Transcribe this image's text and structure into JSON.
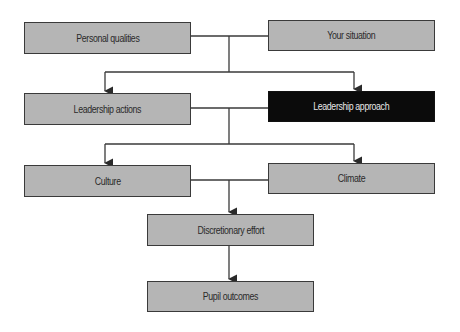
{
  "diagram": {
    "type": "flowchart",
    "colors": {
      "box_fill": "#b5b5b5",
      "box_border": "#3a3a3a",
      "highlight_fill": "#0b0b0b",
      "highlight_text": "#e8e8e8",
      "line": "#3a3a3a"
    },
    "nodes": [
      {
        "id": "personal-qualities",
        "label": "Personal qualities"
      },
      {
        "id": "your-situation",
        "label": "Your situation"
      },
      {
        "id": "leadership-actions",
        "label": "Leadership actions"
      },
      {
        "id": "leadership-approach",
        "label": "Leadership approach",
        "highlighted": true
      },
      {
        "id": "culture",
        "label": "Culture"
      },
      {
        "id": "climate",
        "label": "Climate"
      },
      {
        "id": "discretionary-effort",
        "label": "Discretionary effort"
      },
      {
        "id": "pupil-outcomes",
        "label": "Pupil outcomes"
      }
    ],
    "edges": [
      {
        "from": [
          "personal-qualities",
          "your-situation"
        ],
        "to": [
          "leadership-actions",
          "leadership-approach"
        ]
      },
      {
        "from": [
          "leadership-actions",
          "leadership-approach"
        ],
        "to": [
          "culture",
          "climate"
        ]
      },
      {
        "from": [
          "culture",
          "climate"
        ],
        "to": [
          "discretionary-effort"
        ]
      },
      {
        "from": [
          "discretionary-effort"
        ],
        "to": [
          "pupil-outcomes"
        ]
      }
    ]
  }
}
